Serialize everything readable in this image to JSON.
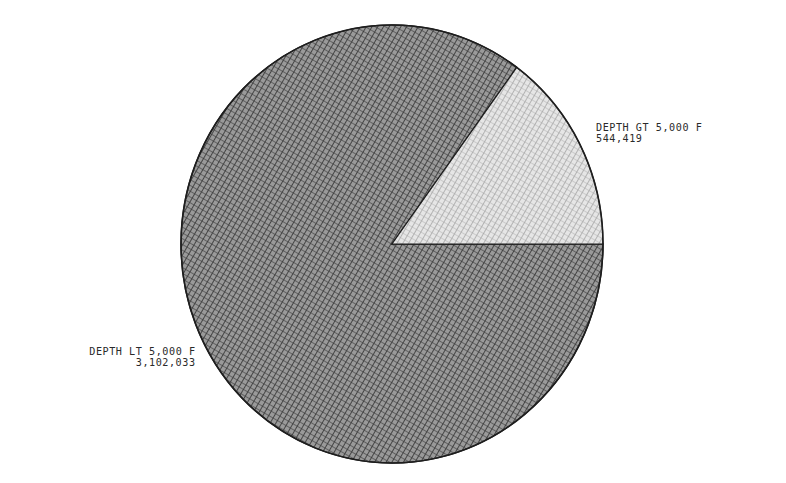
{
  "chart_data": {
    "type": "pie",
    "title": "",
    "slices": [
      {
        "name": "DEPTH GT 5,000 F",
        "value": 544419,
        "value_label": "544,419",
        "pattern": "light-crosshatch"
      },
      {
        "name": "DEPTH LT 5,000 F",
        "value": 3102033,
        "value_label": "3,102,033",
        "pattern": "dense-crosshatch"
      }
    ],
    "total": 3646452,
    "start_angle_deg": 0,
    "direction": "counterclockwise",
    "legend": "none (direct labels)"
  },
  "labels": {
    "gt": {
      "name": "DEPTH GT 5,000 F",
      "value": "544,419"
    },
    "lt": {
      "name": "DEPTH LT 5,000 F",
      "value": "3,102,033"
    }
  },
  "colors": {
    "background": "#ffffff",
    "outline": "#1e1e1e",
    "dense_fill_bg": "#8a8a8a",
    "dense_fill_line": "#2e2e2e",
    "light_fill_bg": "#e2e2e2",
    "light_fill_line": "#8c8c8c",
    "text": "#2a2a2a"
  },
  "geometry": {
    "cx": 392,
    "cy": 244,
    "rx": 211,
    "ry": 219
  }
}
